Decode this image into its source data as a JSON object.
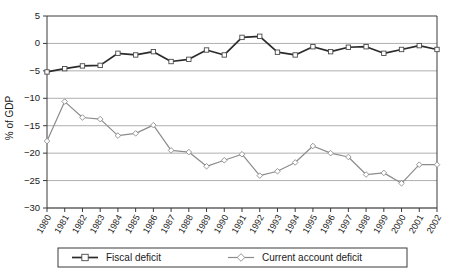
{
  "chart_data": {
    "type": "line",
    "title": "",
    "xlabel": "",
    "ylabel": "% of GDP",
    "ylim": [
      -30,
      5
    ],
    "yticks": [
      5,
      0,
      -5,
      -10,
      -15,
      -20,
      -25,
      -30
    ],
    "ytick_labels": [
      "5",
      "0",
      "−5",
      "−10",
      "−15",
      "−20",
      "−25",
      "−30"
    ],
    "grid": true,
    "grid_axis": "y",
    "legend_position": "bottom",
    "categories": [
      "1980",
      "1981",
      "1982",
      "1983",
      "1984",
      "1985",
      "1986",
      "1987",
      "1988",
      "1989",
      "1990",
      "1991",
      "1992",
      "1993",
      "1994",
      "1995",
      "1996",
      "1997",
      "1998",
      "1999",
      "2000",
      "2001",
      "2002"
    ],
    "series": [
      {
        "name": "Fiscal deficit",
        "marker": "square",
        "color": "#2b2b2b",
        "values": [
          -5.2,
          -4.6,
          -4.1,
          -4.0,
          -1.8,
          -2.1,
          -1.5,
          -3.3,
          -2.9,
          -1.2,
          -2.1,
          1.1,
          1.3,
          -1.6,
          -2.1,
          -0.6,
          -1.5,
          -0.7,
          -0.6,
          -1.8,
          -1.1,
          -0.4,
          -1.1
        ]
      },
      {
        "name": "Current account deficit",
        "marker": "diamond",
        "color": "#8c8c8c",
        "values": [
          -17.8,
          -10.6,
          -13.5,
          -13.8,
          -16.8,
          -16.4,
          -14.9,
          -19.5,
          -19.8,
          -22.4,
          -21.3,
          -20.2,
          -24.1,
          -23.3,
          -21.7,
          -18.7,
          -20.0,
          -20.7,
          -23.9,
          -23.6,
          -25.5,
          -22.1,
          -22.1
        ]
      }
    ]
  },
  "legend": {
    "entries": [
      {
        "label": "Fiscal deficit"
      },
      {
        "label": "Current account deficit"
      }
    ]
  }
}
